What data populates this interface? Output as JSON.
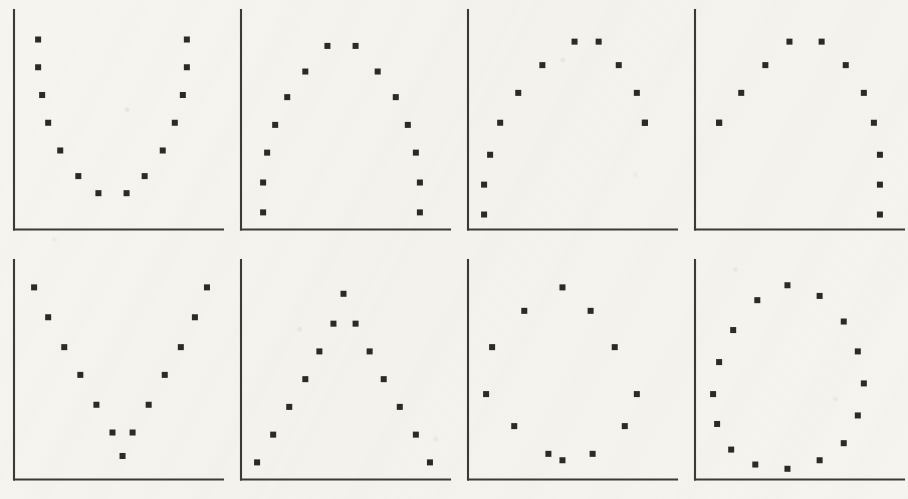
{
  "figure": {
    "title": "",
    "background_color": "#f7f6f2",
    "ink_color": "#2b2a28",
    "axis_color": "#3b3a38",
    "grid_rows": 2,
    "grid_cols": 4,
    "panel_count": 8,
    "marker_shape": "square",
    "marker_size_px": 6
  },
  "chart_data": [
    {
      "type": "scatter",
      "panel": 1,
      "row": 1,
      "col": 1,
      "shape_name": "u-shape",
      "title": "",
      "xlabel": "",
      "ylabel": "",
      "xlim": [
        0,
        100
      ],
      "ylim": [
        0,
        100
      ],
      "grid": false,
      "legend": null,
      "axes_style": "left-and-bottom-spines-only",
      "ticks": false,
      "n_points": 14,
      "x": [
        12,
        12,
        14,
        17,
        23,
        32,
        42,
        56,
        65,
        74,
        80,
        84,
        86,
        86
      ],
      "y": [
        89,
        76,
        63,
        50,
        37,
        25,
        17,
        17,
        25,
        37,
        50,
        63,
        76,
        89
      ]
    },
    {
      "type": "scatter",
      "panel": 2,
      "row": 1,
      "col": 2,
      "shape_name": "inverted-u-arch-symmetric",
      "title": "",
      "xlabel": "",
      "ylabel": "",
      "xlim": [
        0,
        100
      ],
      "ylim": [
        0,
        100
      ],
      "grid": false,
      "legend": null,
      "axes_style": "left-and-bottom-spines-only",
      "ticks": false,
      "n_points": 14,
      "x": [
        11,
        11,
        13,
        17,
        23,
        32,
        43,
        57,
        68,
        77,
        83,
        87,
        89,
        89
      ],
      "y": [
        8,
        22,
        36,
        49,
        62,
        74,
        86,
        86,
        74,
        62,
        49,
        36,
        22,
        8
      ]
    },
    {
      "type": "scatter",
      "panel": 3,
      "row": 1,
      "col": 3,
      "shape_name": "arch-skewed-left",
      "title": "",
      "xlabel": "",
      "ylabel": "",
      "xlim": [
        0,
        100
      ],
      "ylim": [
        0,
        100
      ],
      "grid": false,
      "legend": null,
      "axes_style": "left-and-bottom-spines-only",
      "ticks": false,
      "n_points": 12,
      "x": [
        8,
        8,
        11,
        16,
        25,
        37,
        53,
        65,
        75,
        84,
        88,
        88
      ],
      "y": [
        7,
        21,
        35,
        50,
        64,
        77,
        88,
        88,
        77,
        64,
        50,
        50
      ]
    },
    {
      "type": "scatter",
      "panel": 4,
      "row": 1,
      "col": 4,
      "shape_name": "arch-skewed-right",
      "title": "",
      "xlabel": "",
      "ylabel": "",
      "xlim": [
        0,
        100
      ],
      "ylim": [
        0,
        100
      ],
      "grid": false,
      "legend": null,
      "axes_style": "left-and-bottom-spines-only",
      "ticks": false,
      "n_points": 12,
      "x": [
        12,
        12,
        23,
        35,
        47,
        63,
        75,
        84,
        89,
        92,
        92,
        92
      ],
      "y": [
        50,
        50,
        64,
        77,
        88,
        88,
        77,
        64,
        50,
        35,
        21,
        7
      ]
    },
    {
      "type": "scatter",
      "panel": 5,
      "row": 2,
      "col": 1,
      "shape_name": "v-shape",
      "title": "",
      "xlabel": "",
      "ylabel": "",
      "xlim": [
        0,
        100
      ],
      "ylim": [
        0,
        100
      ],
      "grid": false,
      "legend": null,
      "axes_style": "left-and-bottom-spines-only",
      "ticks": false,
      "n_points": 13,
      "x": [
        10,
        17,
        25,
        33,
        41,
        49,
        54,
        59,
        67,
        75,
        83,
        90,
        96
      ],
      "y": [
        90,
        76,
        62,
        49,
        35,
        22,
        11,
        22,
        35,
        49,
        62,
        76,
        90
      ]
    },
    {
      "type": "scatter",
      "panel": 6,
      "row": 2,
      "col": 2,
      "shape_name": "inverted-v-triangle",
      "title": "",
      "xlabel": "",
      "ylabel": "",
      "xlim": [
        0,
        100
      ],
      "ylim": [
        0,
        100
      ],
      "grid": false,
      "legend": null,
      "axes_style": "left-and-bottom-spines-only",
      "ticks": false,
      "n_points": 13,
      "x": [
        8,
        16,
        24,
        32,
        39,
        46,
        51,
        57,
        64,
        71,
        79,
        87,
        94
      ],
      "y": [
        8,
        21,
        34,
        47,
        60,
        73,
        87,
        73,
        60,
        47,
        34,
        21,
        8
      ]
    },
    {
      "type": "scatter",
      "panel": 7,
      "row": 2,
      "col": 3,
      "shape_name": "circle-12-points",
      "title": "",
      "xlabel": "",
      "ylabel": "",
      "xlim": [
        0,
        100
      ],
      "ylim": [
        0,
        100
      ],
      "grid": false,
      "legend": null,
      "axes_style": "left-and-bottom-spines-only",
      "ticks": false,
      "n_points": 12,
      "x": [
        47,
        28,
        12,
        9,
        23,
        40,
        47,
        62,
        78,
        84,
        73,
        61
      ],
      "y": [
        90,
        79,
        62,
        40,
        25,
        12,
        9,
        12,
        25,
        40,
        62,
        79
      ]
    },
    {
      "type": "scatter",
      "panel": 8,
      "row": 2,
      "col": 4,
      "shape_name": "ellipse-16-points",
      "title": "",
      "xlabel": "",
      "ylabel": "",
      "xlim": [
        0,
        100
      ],
      "ylim": [
        0,
        100
      ],
      "grid": false,
      "legend": null,
      "axes_style": "left-and-bottom-spines-only",
      "ticks": false,
      "n_points": 16,
      "x": [
        46,
        31,
        19,
        12,
        9,
        11,
        18,
        30,
        46,
        62,
        74,
        81,
        84,
        81,
        74,
        62
      ],
      "y": [
        91,
        84,
        70,
        55,
        40,
        26,
        14,
        7,
        5,
        9,
        17,
        30,
        45,
        60,
        74,
        86
      ]
    }
  ]
}
